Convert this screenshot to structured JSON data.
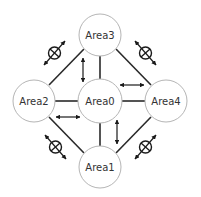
{
  "diagram": {
    "type": "network-topology",
    "colors": {
      "background": "#ffffff",
      "node_fill": "#ffffff",
      "node_stroke": "#b5b5b5",
      "line": "#2a2a2a",
      "label": "#333333"
    },
    "nodes": [
      {
        "id": "area0",
        "label": "Area0",
        "cx": 100,
        "cy": 101,
        "r": 22
      },
      {
        "id": "area1",
        "label": "Area1",
        "cx": 100,
        "cy": 167,
        "r": 21
      },
      {
        "id": "area2",
        "label": "Area2",
        "cx": 34,
        "cy": 101,
        "r": 21
      },
      {
        "id": "area3",
        "label": "Area3",
        "cx": 100,
        "cy": 35,
        "r": 21
      },
      {
        "id": "area4",
        "label": "Area4",
        "cx": 166,
        "cy": 101,
        "r": 21
      }
    ],
    "links": [
      {
        "from": "area3",
        "to": "area2"
      },
      {
        "from": "area3",
        "to": "area4"
      },
      {
        "from": "area2",
        "to": "area1"
      },
      {
        "from": "area4",
        "to": "area1"
      },
      {
        "from": "area0",
        "to": "area3"
      },
      {
        "from": "area0",
        "to": "area2"
      },
      {
        "from": "area0",
        "to": "area4"
      },
      {
        "from": "area0",
        "to": "area1"
      }
    ],
    "allowed_flows": [
      {
        "between": [
          "area3",
          "area0"
        ],
        "direction": "bidirectional"
      },
      {
        "between": [
          "area0",
          "area4"
        ],
        "direction": "bidirectional"
      },
      {
        "between": [
          "area2",
          "area0"
        ],
        "direction": "bidirectional"
      },
      {
        "between": [
          "area0",
          "area1"
        ],
        "direction": "bidirectional"
      }
    ],
    "prohibited_flows": [
      {
        "between": [
          "area2",
          "area3"
        ],
        "symbol": "prohibited-icon"
      },
      {
        "between": [
          "area3",
          "area4"
        ],
        "symbol": "prohibited-icon"
      },
      {
        "between": [
          "area2",
          "area1"
        ],
        "symbol": "prohibited-icon"
      },
      {
        "between": [
          "area4",
          "area1"
        ],
        "symbol": "prohibited-icon"
      }
    ]
  }
}
